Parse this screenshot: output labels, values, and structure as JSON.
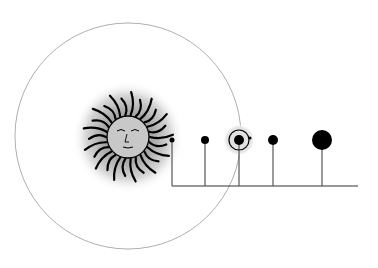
{
  "diagram": {
    "type": "solar-system-orrery",
    "colors": {
      "background": "#ffffff",
      "ink": "#000000",
      "orbit_line": "#9a9a9a",
      "stem": "#555555",
      "glow": "#bdbdbd"
    },
    "outer_orbit": {
      "cx": 128,
      "cy": 136,
      "r": 113
    },
    "sun": {
      "label": "sun",
      "cx": 128,
      "cy": 137,
      "glow_r": 56,
      "face_r": 21,
      "rays": 26
    },
    "baseline": {
      "x1": 172,
      "x2": 358,
      "y": 186
    },
    "planets": [
      {
        "name": "planet-1",
        "cx": 172,
        "cy": 140,
        "r": 2.5
      },
      {
        "name": "planet-2",
        "cx": 205,
        "cy": 140,
        "r": 4
      },
      {
        "name": "planet-3-earth",
        "cx": 239,
        "cy": 140,
        "r": 5,
        "orbit_ring_r": 10,
        "highlight_r": 16,
        "moon": {
          "cx": 250,
          "cy": 138,
          "r": 1.5
        }
      },
      {
        "name": "planet-4",
        "cx": 273,
        "cy": 140,
        "r": 5
      },
      {
        "name": "planet-5",
        "cx": 322,
        "cy": 140,
        "r": 10
      }
    ]
  }
}
